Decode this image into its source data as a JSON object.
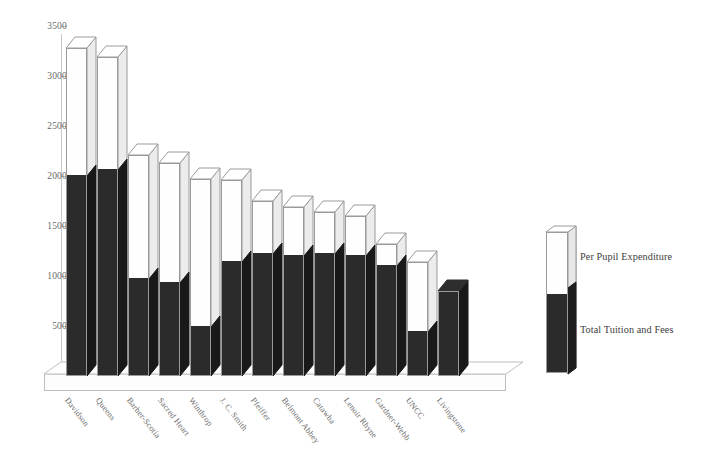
{
  "chart_data": {
    "type": "bar",
    "subtype": "stacked-3d-column",
    "title": "",
    "subtitle": "",
    "xlabel": "",
    "ylabel": "",
    "ylim": [
      0,
      3500
    ],
    "y_ticks": [
      0,
      500,
      1000,
      1500,
      2000,
      2500,
      3000,
      3500
    ],
    "y_tick_labels": [
      "",
      "500",
      "1000",
      "1500",
      "2000",
      "2500",
      "3000",
      "3500"
    ],
    "grid": false,
    "legend_position": "right",
    "categories": [
      "Davidson",
      "Queens",
      "Barber-Scotia",
      "Sacred Heart",
      "Winthrop",
      "J. C. Smith",
      "Pfeiffer",
      "Belmont Abbey",
      "Catawba",
      "Lenoir Rhyne",
      "Gardner-Webb",
      "UNCC",
      "Livingstone"
    ],
    "series": [
      {
        "name": "Total Tuition and Fees",
        "color": "#2b2b2b",
        "values": [
          2000,
          2060,
          970,
          930,
          490,
          1140,
          1220,
          1200,
          1220,
          1200,
          1100,
          440,
          850
        ]
      },
      {
        "name": "Per Pupil Expenditure",
        "color": "#fefefe",
        "values": [
          1280,
          1130,
          1240,
          1200,
          1480,
          820,
          530,
          490,
          420,
          400,
          220,
          700,
          0
        ]
      }
    ],
    "totals": [
      3280,
      3190,
      2210,
      2130,
      1970,
      1960,
      1750,
      1690,
      1640,
      1600,
      1320,
      1140,
      850
    ]
  },
  "legend": {
    "expenditure_label": "Per Pupil Expenditure",
    "tuition_label": "Total Tuition and Fees"
  },
  "colors": {
    "tuition": "#2b2b2b",
    "expenditure": "#fefefe",
    "axis": "#c9c9c9",
    "outline": "#9a9a9a",
    "background": "#ffffff",
    "text": "#5b5b5b"
  }
}
